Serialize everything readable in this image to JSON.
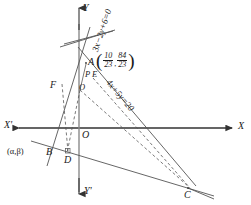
{
  "figure": {
    "kind": "coordinate-geometry-diagram",
    "stroke_color": "#333333",
    "background": "#ffffff"
  },
  "axes": {
    "x_positive_label": "X",
    "x_negative_label": "X'",
    "y_positive_label": "Y",
    "y_negative_label": "Y'",
    "origin_label": "O"
  },
  "points": [
    {
      "id": "A",
      "label": "A",
      "x": 88,
      "y": 62
    },
    {
      "id": "B",
      "label": "B",
      "x": 52,
      "y": 152
    },
    {
      "id": "C",
      "label": "C",
      "x": 188,
      "y": 188
    },
    {
      "id": "D",
      "label": "D",
      "x": 67,
      "y": 156
    },
    {
      "id": "E",
      "label": "E",
      "x": 95,
      "y": 75
    },
    {
      "id": "F",
      "label": "F",
      "x": 57,
      "y": 85
    },
    {
      "id": "P",
      "label": "P",
      "x": 88,
      "y": 74
    },
    {
      "id": "Q",
      "label": "O",
      "x": 80,
      "y": 88
    }
  ],
  "equations": {
    "line1": "3x−2y+6=0",
    "line2": "4x+5y=20"
  },
  "annotations": {
    "point_a_coord": {
      "open_paren": "(",
      "close_paren": ")",
      "comma": ",",
      "first_num": "10",
      "first_den": "23",
      "second_num": "84",
      "second_den": "23"
    },
    "alpha_beta": "(α,β)"
  }
}
